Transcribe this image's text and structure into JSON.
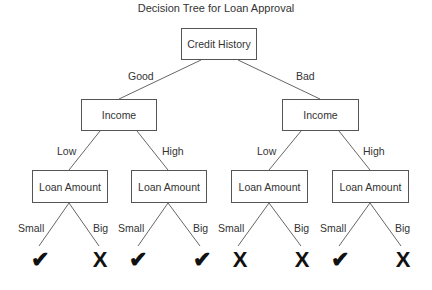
{
  "title": "Decision Tree for Loan Approval",
  "root": {
    "label": "Credit History"
  },
  "edges_level1": [
    "Good",
    "Bad"
  ],
  "level1": [
    {
      "label": "Income"
    },
    {
      "label": "Income"
    }
  ],
  "edges_level2": [
    "Low",
    "High",
    "Low",
    "High"
  ],
  "level2": [
    {
      "label": "Loan Amount"
    },
    {
      "label": "Loan Amount"
    },
    {
      "label": "Loan Amount"
    },
    {
      "label": "Loan Amount"
    }
  ],
  "edges_level3": [
    "Small",
    "Big",
    "Small",
    "Big",
    "Small",
    "Big",
    "Small",
    "Big"
  ],
  "leaves": [
    {
      "icon": "check-icon",
      "glyph": "✔"
    },
    {
      "icon": "cross-icon",
      "glyph": "X"
    },
    {
      "icon": "check-icon",
      "glyph": "✔"
    },
    {
      "icon": "check-icon",
      "glyph": "✔"
    },
    {
      "icon": "cross-icon",
      "glyph": "X"
    },
    {
      "icon": "cross-icon",
      "glyph": "X"
    },
    {
      "icon": "check-icon",
      "glyph": "✔"
    },
    {
      "icon": "cross-icon",
      "glyph": "X"
    }
  ]
}
